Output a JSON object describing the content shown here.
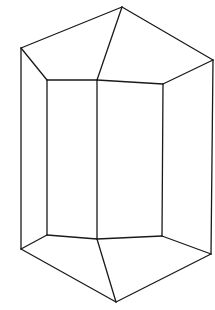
{
  "diagram": {
    "stroke_color": "#1a1a1a",
    "background": "#ffffff",
    "stroke_width": 1.3,
    "vertices": {
      "top_apex": [
        122,
        7
      ],
      "top_left": [
        21,
        48
      ],
      "top_right": [
        213,
        60
      ],
      "top_inner_left": [
        47,
        80
      ],
      "top_inner_mid": [
        97,
        80
      ],
      "top_inner_right": [
        163,
        84
      ],
      "bottom_left": [
        21,
        249
      ],
      "bottom_right": [
        211,
        254
      ],
      "bottom_inner_left": [
        47,
        235
      ],
      "bottom_inner_mid": [
        97,
        239
      ],
      "bottom_inner_right": [
        162,
        236
      ],
      "bottom_apex": [
        116,
        302
      ]
    },
    "edges": [
      [
        "top_left",
        "top_apex"
      ],
      [
        "top_apex",
        "top_right"
      ],
      [
        "top_apex",
        "top_inner_mid"
      ],
      [
        "top_left",
        "top_inner_left"
      ],
      [
        "top_inner_left",
        "top_inner_mid"
      ],
      [
        "top_inner_mid",
        "top_inner_right"
      ],
      [
        "top_inner_right",
        "top_right"
      ],
      [
        "top_left",
        "bottom_left"
      ],
      [
        "top_right",
        "bottom_right"
      ],
      [
        "top_inner_left",
        "bottom_inner_left"
      ],
      [
        "top_inner_mid",
        "bottom_inner_mid"
      ],
      [
        "top_inner_right",
        "bottom_inner_right"
      ],
      [
        "bottom_left",
        "bottom_inner_left"
      ],
      [
        "bottom_inner_left",
        "bottom_inner_mid"
      ],
      [
        "bottom_inner_mid",
        "bottom_inner_right"
      ],
      [
        "bottom_inner_right",
        "bottom_right"
      ],
      [
        "bottom_left",
        "bottom_apex"
      ],
      [
        "bottom_inner_mid",
        "bottom_apex"
      ],
      [
        "bottom_apex",
        "bottom_right"
      ]
    ]
  }
}
